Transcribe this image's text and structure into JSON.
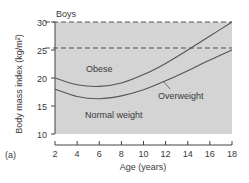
{
  "chart_data": {
    "type": "line",
    "title": "Boys",
    "panel_label": "(a)",
    "xlabel": "Age (years)",
    "ylabel": "Body mass index (kg/m²)",
    "xlim": [
      2,
      18
    ],
    "ylim": [
      10,
      30
    ],
    "xticks": [
      "2",
      "4",
      "6",
      "8",
      "10",
      "12",
      "14",
      "16",
      "18"
    ],
    "yticks": [
      "10",
      "15",
      "20",
      "25",
      "30"
    ],
    "reference_lines": [
      {
        "y": 30,
        "style": "dashed"
      },
      {
        "y": 25,
        "style": "dashed"
      }
    ],
    "series": [
      {
        "name": "Obese threshold",
        "x": [
          2,
          4,
          6,
          8,
          10,
          12,
          14,
          16,
          18
        ],
        "values": [
          20.0,
          18.8,
          18.5,
          19.1,
          20.6,
          22.6,
          25.0,
          27.5,
          30.0
        ]
      },
      {
        "name": "Overweight threshold",
        "x": [
          2,
          4,
          6,
          8,
          10,
          12,
          14,
          16,
          18
        ],
        "values": [
          18.0,
          16.7,
          16.3,
          16.8,
          17.9,
          19.5,
          21.3,
          23.2,
          25.0
        ]
      }
    ],
    "region_labels": [
      "Obese",
      "Overweight",
      "Normal weight"
    ],
    "grid": false,
    "legend": "none",
    "background_fill": "#d3d3d3"
  }
}
